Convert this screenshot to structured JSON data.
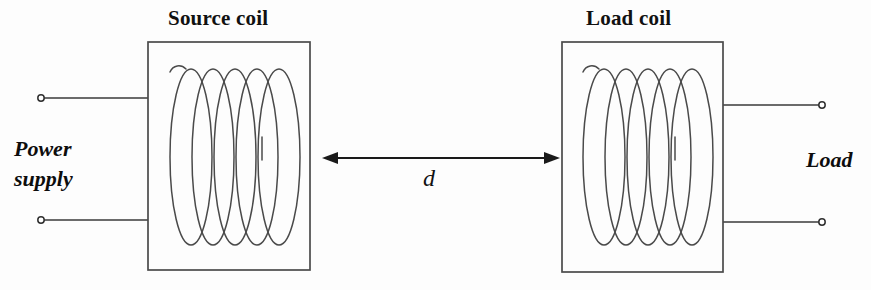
{
  "diagram": {
    "title_source_coil": "Source coil",
    "title_load_coil": "Load coil",
    "label_power_supply_line1": "Power",
    "label_power_supply_line2": "supply",
    "label_load": "Load",
    "label_distance": "d",
    "colors": {
      "background": "#fdfdfd",
      "stroke": "#3a3a3a",
      "coil_stroke": "#4a4a4a",
      "text": "#111111",
      "arrow": "#1a1a1a"
    },
    "geometry": {
      "source_box": {
        "x": 148,
        "y": 42,
        "width": 162,
        "height": 228
      },
      "load_box": {
        "x": 562,
        "y": 42,
        "width": 161,
        "height": 230
      },
      "coil_turns": 5,
      "arrow": {
        "x1": 322,
        "x2": 560,
        "y": 158
      },
      "terminals": [
        {
          "name": "source-top",
          "cx": 41,
          "cy": 98
        },
        {
          "name": "source-bottom",
          "cx": 41,
          "cy": 220
        },
        {
          "name": "load-top",
          "cx": 822,
          "cy": 105
        },
        {
          "name": "load-bottom",
          "cx": 822,
          "cy": 222
        }
      ]
    }
  }
}
